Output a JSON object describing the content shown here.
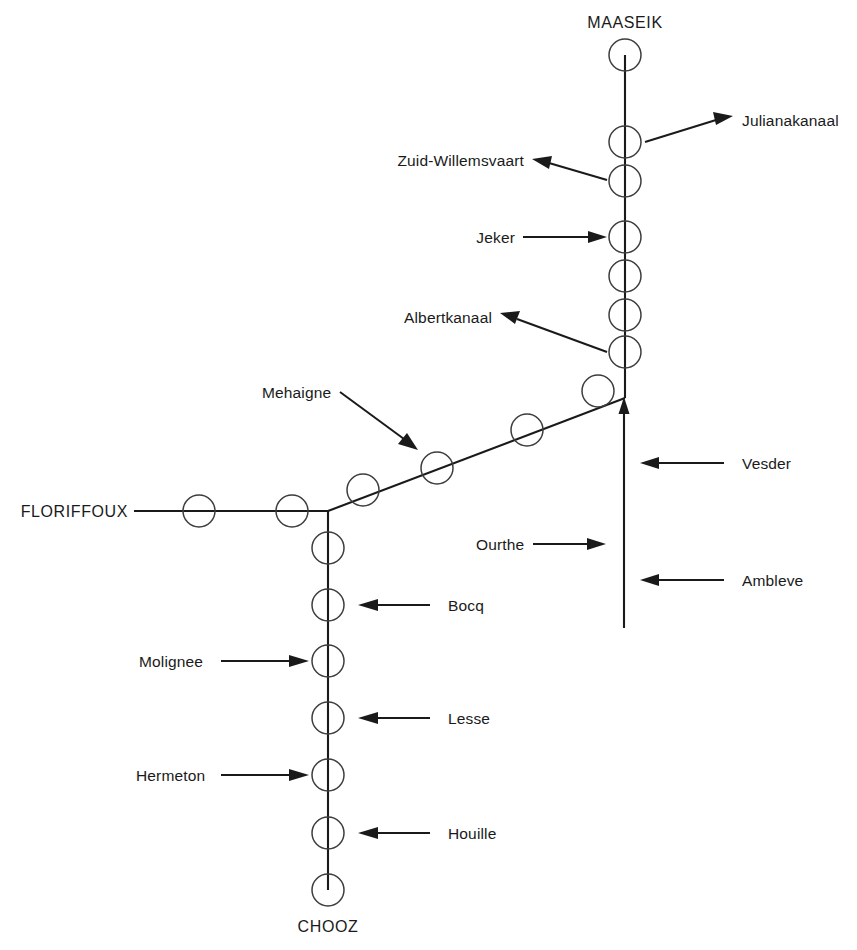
{
  "diagram": {
    "background_color": "#ffffff",
    "line_color": "#1a1a1a",
    "circle_color": "#3d3d3d",
    "terminals": {
      "top": "MAASEIK",
      "left": "FLORIFFOUX",
      "bottom": "CHOOZ"
    },
    "tributary_labels": {
      "julianakanaal": "Julianakanaal",
      "zuid_willemsvaart": "Zuid-Willemsvaart",
      "jeker": "Jeker",
      "albertkanaal": "Albertkanaal",
      "mehaigne": "Mehaigne",
      "vesder": "Vesder",
      "ourthe": "Ourthe",
      "ambleve": "Ambleve",
      "bocq": "Bocq",
      "molignee": "Molignee",
      "lesse": "Lesse",
      "hermeton": "Hermeton",
      "houille": "Houille"
    },
    "station_counts": {
      "main_vertical": 7,
      "diagonal": 4,
      "horizontal_left": 2,
      "lower_vertical": 8
    },
    "caption_partial": "partial cut-off caption line"
  }
}
